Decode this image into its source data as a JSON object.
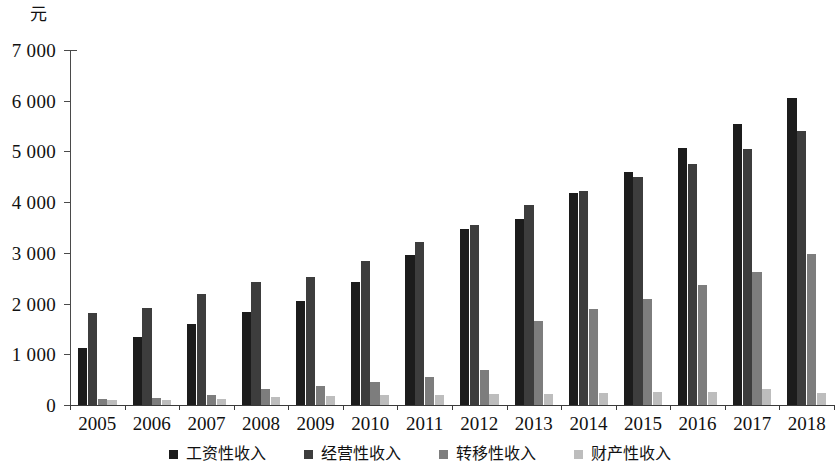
{
  "chart_data": {
    "type": "bar",
    "title": "",
    "subtitle": "",
    "xlabel": "",
    "ylabel": "",
    "unit_label": "元",
    "grid": false,
    "legend_position": "bottom",
    "ylim": [
      0,
      7000
    ],
    "ytick_values": [
      0,
      1000,
      2000,
      3000,
      4000,
      5000,
      6000,
      7000
    ],
    "ytick_labels": [
      "0",
      "1 000",
      "2 000",
      "3 000",
      "4 000",
      "5 000",
      "6 000",
      "7 000"
    ],
    "categories": [
      "2005",
      "2006",
      "2007",
      "2008",
      "2009",
      "2010",
      "2011",
      "2012",
      "2013",
      "2014",
      "2015",
      "2016",
      "2017",
      "2018"
    ],
    "series": [
      {
        "name": "工资性收入",
        "color": "#1c1c1c",
        "values": [
          1125,
          1350,
          1590,
          1840,
          2060,
          2430,
          2960,
          3470,
          3670,
          4190,
          4600,
          5060,
          5540,
          6050
        ]
      },
      {
        "name": "经营性收入",
        "color": "#3d3d3d",
        "values": [
          1820,
          1920,
          2180,
          2430,
          2530,
          2840,
          3220,
          3540,
          3950,
          4220,
          4500,
          4760,
          5050,
          5400
        ]
      },
      {
        "name": "转移性收入",
        "color": "#7d7d7d",
        "values": [
          120,
          140,
          190,
          320,
          370,
          450,
          560,
          700,
          1660,
          1890,
          2090,
          2370,
          2630,
          2970
        ]
      },
      {
        "name": "财产性收入",
        "color": "#bdbdbd",
        "values": [
          90,
          100,
          110,
          150,
          180,
          190,
          200,
          220,
          220,
          240,
          250,
          250,
          320,
          230
        ]
      }
    ]
  }
}
